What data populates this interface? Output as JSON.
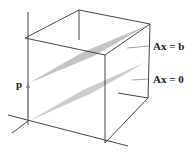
{
  "figure": {
    "labels": {
      "upper_plane": "Ax = b",
      "lower_plane": "Ax = 0",
      "particular_vector": "p"
    },
    "colors": {
      "plane_fill": "#c8c8c8",
      "edge": "#333333",
      "label_line": "#777777"
    }
  }
}
